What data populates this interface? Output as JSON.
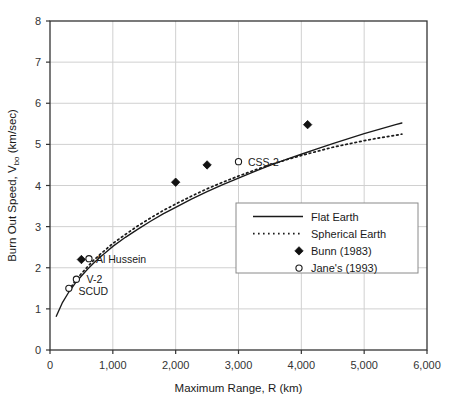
{
  "chart_data": {
    "type": "line",
    "title": "",
    "xlabel": "Maximum Range, R (km)",
    "ylabel_main": "Burn Out Speed, V",
    "ylabel_sub": "bo",
    "ylabel_units": " (km/sec)",
    "xlim": [
      0,
      6000
    ],
    "ylim": [
      0,
      8
    ],
    "xticks": [
      0,
      1000,
      2000,
      3000,
      4000,
      5000,
      6000
    ],
    "xtick_labels": [
      "0",
      "1,000",
      "2,000",
      "3,000",
      "4,000",
      "5,000",
      "6,000"
    ],
    "yticks": [
      0,
      1,
      2,
      3,
      4,
      5,
      6,
      7,
      8
    ],
    "ytick_labels": [
      "0",
      "1",
      "2",
      "3",
      "4",
      "5",
      "6",
      "7",
      "8"
    ],
    "grid": true,
    "legend_position": "center-right",
    "series": [
      {
        "name": "Flat Earth",
        "style": "solid",
        "color": "#1a1a1a",
        "points": [
          [
            100,
            0.82
          ],
          [
            200,
            1.16
          ],
          [
            300,
            1.41
          ],
          [
            400,
            1.62
          ],
          [
            500,
            1.8
          ],
          [
            600,
            1.97
          ],
          [
            700,
            2.12
          ],
          [
            800,
            2.26
          ],
          [
            900,
            2.39
          ],
          [
            1000,
            2.52
          ],
          [
            1200,
            2.74
          ],
          [
            1400,
            2.94
          ],
          [
            1600,
            3.13
          ],
          [
            1800,
            3.31
          ],
          [
            2000,
            3.47
          ],
          [
            2250,
            3.67
          ],
          [
            2500,
            3.85
          ],
          [
            2750,
            4.02
          ],
          [
            3000,
            4.18
          ],
          [
            3250,
            4.34
          ],
          [
            3500,
            4.49
          ],
          [
            3750,
            4.63
          ],
          [
            4000,
            4.76
          ],
          [
            4250,
            4.89
          ],
          [
            4500,
            5.02
          ],
          [
            4750,
            5.14
          ],
          [
            5000,
            5.26
          ],
          [
            5250,
            5.37
          ],
          [
            5500,
            5.48
          ],
          [
            5600,
            5.52
          ]
        ]
      },
      {
        "name": "Spherical Earth",
        "style": "dotted",
        "color": "#1a1a1a",
        "points": [
          [
            300,
            1.45
          ],
          [
            400,
            1.68
          ],
          [
            500,
            1.86
          ],
          [
            600,
            2.03
          ],
          [
            700,
            2.19
          ],
          [
            800,
            2.33
          ],
          [
            900,
            2.46
          ],
          [
            1000,
            2.59
          ],
          [
            1200,
            2.81
          ],
          [
            1400,
            3.02
          ],
          [
            1600,
            3.21
          ],
          [
            1800,
            3.39
          ],
          [
            2000,
            3.55
          ],
          [
            2250,
            3.74
          ],
          [
            2500,
            3.92
          ],
          [
            2750,
            4.08
          ],
          [
            3000,
            4.23
          ],
          [
            3250,
            4.37
          ],
          [
            3500,
            4.5
          ],
          [
            3750,
            4.62
          ],
          [
            4000,
            4.73
          ],
          [
            4250,
            4.83
          ],
          [
            4500,
            4.93
          ],
          [
            4750,
            5.01
          ],
          [
            5000,
            5.09
          ],
          [
            5250,
            5.16
          ],
          [
            5500,
            5.22
          ],
          [
            5600,
            5.25
          ]
        ]
      }
    ],
    "markers": [
      {
        "series": "Bunn (1983)",
        "shape": "filled-diamond",
        "x": 500,
        "y": 2.2,
        "label": ""
      },
      {
        "series": "Bunn (1983)",
        "shape": "filled-diamond",
        "x": 2000,
        "y": 4.08,
        "label": ""
      },
      {
        "series": "Bunn (1983)",
        "shape": "filled-diamond",
        "x": 2500,
        "y": 4.5,
        "label": ""
      },
      {
        "series": "Bunn (1983)",
        "shape": "filled-diamond",
        "x": 4100,
        "y": 5.48,
        "label": ""
      },
      {
        "series": "Jane's (1993)",
        "shape": "open-circle",
        "x": 300,
        "y": 1.5,
        "label": "SCUD"
      },
      {
        "series": "Jane's (1993)",
        "shape": "open-circle",
        "x": 420,
        "y": 1.72,
        "label": "V-2"
      },
      {
        "series": "Jane's (1993)",
        "shape": "open-circle",
        "x": 620,
        "y": 2.22,
        "label": "Al Hussein"
      },
      {
        "series": "Jane's (1993)",
        "shape": "open-circle",
        "x": 3000,
        "y": 4.58,
        "label": "CSS-2"
      }
    ],
    "annotations": [
      {
        "text": "Al Hussein",
        "x": 700,
        "y": 2.22
      },
      {
        "text": "V-2",
        "x": 550,
        "y": 1.72
      },
      {
        "text": "SCUD",
        "x": 420,
        "y": 1.44
      },
      {
        "text": "CSS-2",
        "x": 3120,
        "y": 4.56
      }
    ],
    "legend": [
      {
        "label": "Flat Earth",
        "marker": "solid-line"
      },
      {
        "label": "Spherical Earth",
        "marker": "dotted-line"
      },
      {
        "label": "Bunn (1983)",
        "marker": "filled-diamond"
      },
      {
        "label": "Jane's (1993)",
        "marker": "open-circle"
      }
    ],
    "colors": {
      "axis": "#333333",
      "grid": "#d0d0d0",
      "curve": "#1a1a1a",
      "background": "#ffffff"
    }
  }
}
